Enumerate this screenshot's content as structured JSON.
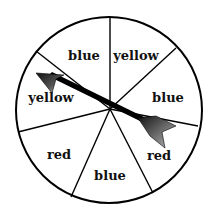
{
  "spinner": {
    "center": [
      109,
      109
    ],
    "radius": 93,
    "sections": [
      {
        "label": "blue",
        "x": 84,
        "y": 59
      },
      {
        "label": "yellow",
        "x": 135,
        "y": 59
      },
      {
        "label": "blue",
        "x": 168,
        "y": 101
      },
      {
        "label": "yellow",
        "x": 51,
        "y": 101
      },
      {
        "label": "red",
        "x": 59,
        "y": 158
      },
      {
        "label": "blue",
        "x": 110,
        "y": 179
      },
      {
        "label": "red",
        "x": 159,
        "y": 160
      }
    ],
    "divider_ends": [
      [
        110,
        15
      ],
      [
        176,
        48
      ],
      [
        198,
        125
      ],
      [
        152,
        193
      ],
      [
        71,
        197
      ],
      [
        18,
        132
      ],
      [
        36,
        51
      ]
    ],
    "pointer": {
      "points_to": "yellow"
    }
  }
}
